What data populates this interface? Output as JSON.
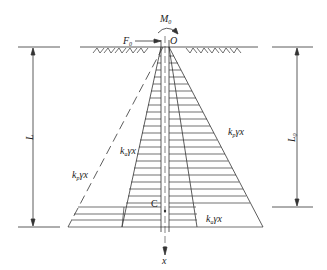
{
  "figure": {
    "type": "lateral earth pressure distribution on pile",
    "labels": {
      "origin": "O",
      "moment": "M",
      "moment_sub": "0",
      "force": "F",
      "force_sub": "0",
      "length_left": "L",
      "length_right": "L",
      "length_right_sub": "0",
      "centroid": "C",
      "axis_x": "x",
      "passive_left": "k",
      "passive_left_sub": "p",
      "passive_left_rest": "γx",
      "active_left": "k",
      "active_left_sub": "a",
      "active_left_rest": "γx",
      "passive_right": "k",
      "passive_right_sub": "p",
      "passive_right_rest": "γx",
      "active_right": "k",
      "active_right_sub": "a",
      "active_right_rest": "γx"
    },
    "colors": {
      "line": "#333333",
      "background": "#ffffff"
    }
  }
}
